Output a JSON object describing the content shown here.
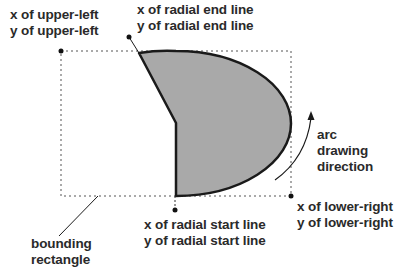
{
  "labels": {
    "upper_left": [
      "x of upper-left",
      "y of upper-left"
    ],
    "radial_end": [
      "x of radial end line",
      "y of radial end line"
    ],
    "arc_direction": [
      "arc",
      "drawing",
      "direction"
    ],
    "lower_right": [
      "x of lower-right",
      "y of lower-right"
    ],
    "radial_start": [
      "x of radial start line",
      "y of radial start line"
    ],
    "bounding_rectangle": [
      "bounding",
      "rectangle"
    ]
  },
  "colors": {
    "pie_fill": "#a9a9a9",
    "stroke": "#1a1a1a",
    "text": "#2a2a2a"
  }
}
